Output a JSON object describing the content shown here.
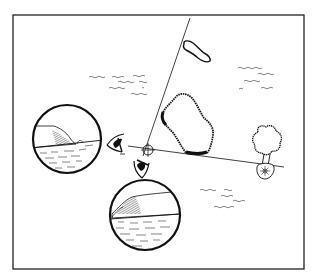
{
  "caption": "",
  "diagram": {
    "type": "navigation-triangulation",
    "colors": {
      "ink": "#111111",
      "paper": "#ffffff",
      "frame": "#222222"
    },
    "elements": {
      "bearing_line_1": {
        "label": "",
        "target": "headland / island"
      },
      "bearing_line_2": {
        "label": "",
        "target": "tree landmark"
      },
      "fix_point": {
        "icon": "crosshair-icon"
      },
      "view_circle_left": {
        "content": "coastline view along west bearing"
      },
      "view_circle_bottom": {
        "content": "coastline view along south bearing"
      },
      "eye_left": {
        "icon": "eye-icon",
        "direction": "left"
      },
      "eye_down": {
        "icon": "eye-icon",
        "direction": "down"
      },
      "landmarks": [
        "small-island",
        "large-island",
        "tree",
        "sun-compass"
      ]
    }
  }
}
